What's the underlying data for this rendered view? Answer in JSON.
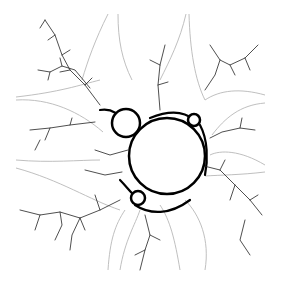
{
  "image": {
    "subject": "mandelbrot-set-fractal",
    "background_color": "#ffffff",
    "set_color": "#000000",
    "field_line_color": "#b8b8b8",
    "bulbs": [
      {
        "name": "main",
        "cx": 167,
        "cy": 156,
        "r": 38
      },
      {
        "name": "left",
        "cx": 126,
        "cy": 123,
        "r": 14
      },
      {
        "name": "top-right",
        "cx": 194,
        "cy": 120,
        "r": 6
      },
      {
        "name": "bottom-left",
        "cx": 138,
        "cy": 198,
        "r": 7
      }
    ]
  }
}
